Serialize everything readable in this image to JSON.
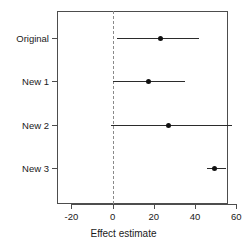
{
  "chart_data": {
    "type": "scatter",
    "subtype": "forest-plot",
    "title": "",
    "xlabel": "Effect estimate",
    "ylabel": "",
    "categories": [
      "Original",
      "New 1",
      "New 2",
      "New 3"
    ],
    "xlim": [
      -27,
      56
    ],
    "xticks": [
      -20,
      0,
      20,
      40,
      60
    ],
    "xticklabels": [
      "-20",
      "0",
      "20",
      "40",
      "60"
    ],
    "grid": false,
    "legend": null,
    "reference_line": {
      "value": 0,
      "style": "dashed",
      "color": "#8a8a8a"
    },
    "point_color": "#111111",
    "line_color": "#2b2b2b",
    "series": [
      {
        "name": "Original",
        "estimate": 23,
        "ci_low": 2,
        "ci_high": 42
      },
      {
        "name": "New 1",
        "estimate": 17,
        "ci_low": 0,
        "ci_high": 35
      },
      {
        "name": "New 2",
        "estimate": 27,
        "ci_low": -1,
        "ci_high": 58
      },
      {
        "name": "New 3",
        "estimate": 49,
        "ci_low": 46,
        "ci_high": 55
      }
    ]
  },
  "axis": {
    "x_label": "Effect estimate",
    "tick_0": "-20",
    "tick_1": "0",
    "tick_2": "20",
    "tick_3": "40",
    "tick_4": "60"
  },
  "rows": {
    "r0": "Original",
    "r1": "New 1",
    "r2": "New 2",
    "r3": "New 3"
  }
}
